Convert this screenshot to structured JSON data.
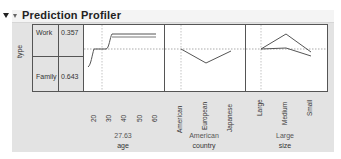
{
  "panel": {
    "title": "Prediction Profiler",
    "response_label": "type",
    "responses": [
      {
        "label": "Work",
        "value": "0.357"
      },
      {
        "label": "Family",
        "value": "0.643"
      }
    ]
  },
  "profiles": [
    {
      "variable": "age",
      "current": "27.63",
      "ticks": [
        "20",
        "30",
        "40",
        "50",
        "60"
      ]
    },
    {
      "variable": "country",
      "current": "American",
      "ticks": [
        "American",
        "European",
        "Japanese"
      ]
    },
    {
      "variable": "size",
      "current": "Large",
      "ticks": [
        "Large",
        "Medium",
        "Small"
      ]
    }
  ],
  "colors": {
    "background": "#e3e3e3",
    "plot_bg": "#ffffff",
    "line": "#555555"
  }
}
